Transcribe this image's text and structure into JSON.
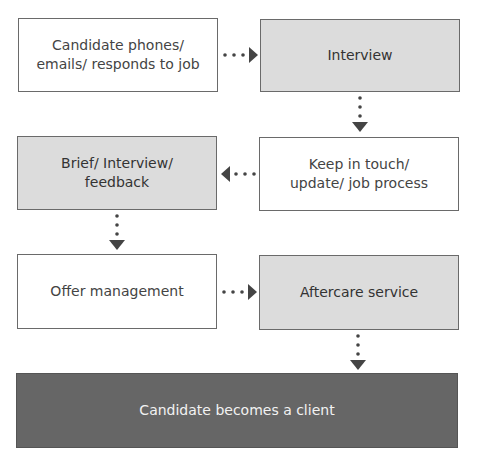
{
  "diagram": {
    "nodes": [
      {
        "id": "n1",
        "label": "Candidate phones/ emails/ responds to job",
        "line1": "Candidate phones/",
        "line2": "emails/ responds to job",
        "style": "white"
      },
      {
        "id": "n2",
        "label": "Interview",
        "style": "grey"
      },
      {
        "id": "n3",
        "label": "Keep in touch/ update/ job process",
        "line1": "Keep in touch/",
        "line2": "update/ job process",
        "style": "white"
      },
      {
        "id": "n4",
        "label": "Brief/ Interview/ feedback",
        "line1": "Brief/ Interview/",
        "line2": "feedback",
        "style": "grey"
      },
      {
        "id": "n5",
        "label": "Offer management",
        "style": "white"
      },
      {
        "id": "n6",
        "label": "Aftercare service",
        "style": "grey"
      },
      {
        "id": "n7",
        "label": "Candidate becomes a client",
        "style": "dark"
      }
    ],
    "edges": [
      {
        "from": "n1",
        "to": "n2",
        "direction": "right",
        "style": "dotted"
      },
      {
        "from": "n2",
        "to": "n3",
        "direction": "down",
        "style": "dotted"
      },
      {
        "from": "n3",
        "to": "n4",
        "direction": "left",
        "style": "dotted"
      },
      {
        "from": "n4",
        "to": "n5",
        "direction": "down",
        "style": "dotted"
      },
      {
        "from": "n5",
        "to": "n6",
        "direction": "right",
        "style": "dotted"
      },
      {
        "from": "n6",
        "to": "n7",
        "direction": "down",
        "style": "dotted"
      }
    ],
    "colors": {
      "white_fill": "#ffffff",
      "grey_fill": "#dcdcdc",
      "dark_fill": "#666666",
      "border": "#6a6a6a",
      "arrow": "#444444"
    }
  }
}
